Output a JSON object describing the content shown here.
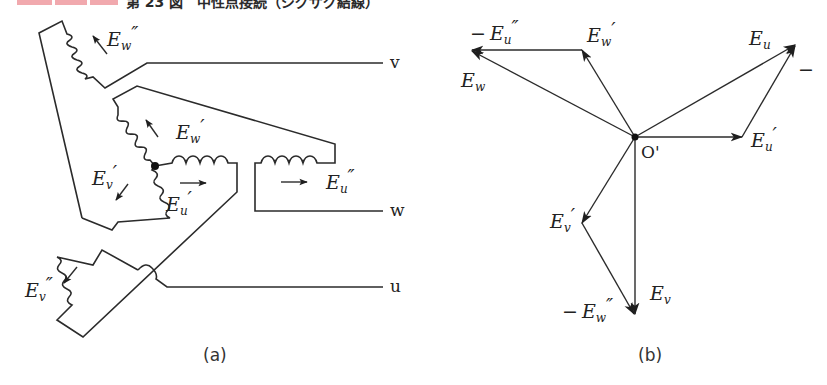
{
  "header": {
    "tag_boxes": [
      "",
      "",
      ""
    ],
    "tag_color": "#f1a9ae",
    "title_cut": "第 23 図　中性点接続（ジグザグ結線）"
  },
  "figure_a": {
    "caption": "(a)",
    "terminals": {
      "v": "v",
      "w": "w",
      "u": "u"
    },
    "windings": [
      {
        "id": "Ew2",
        "base": "E",
        "sub": "w",
        "prime": "″"
      },
      {
        "id": "Ew1",
        "base": "E",
        "sub": "w",
        "prime": "′"
      },
      {
        "id": "Ev1",
        "base": "E",
        "sub": "v",
        "prime": "′"
      },
      {
        "id": "Eu1",
        "base": "E",
        "sub": "u",
        "prime": "′"
      },
      {
        "id": "Eu2",
        "base": "E",
        "sub": "u",
        "prime": "″"
      },
      {
        "id": "Ev2",
        "base": "E",
        "sub": "v",
        "prime": "″"
      }
    ]
  },
  "figure_b": {
    "caption": "(b)",
    "origin_label": "O'",
    "phasors": [
      {
        "id": "neg_Eu2",
        "sign": "−",
        "base": "E",
        "sub": "u",
        "prime": "″"
      },
      {
        "id": "Ew1",
        "sign": "",
        "base": "E",
        "sub": "w",
        "prime": "′"
      },
      {
        "id": "Ew",
        "sign": "",
        "base": "E",
        "sub": "w",
        "prime": ""
      },
      {
        "id": "Eu",
        "sign": "",
        "base": "E",
        "sub": "u",
        "prime": ""
      },
      {
        "id": "Eu1",
        "sign": "",
        "base": "E",
        "sub": "u",
        "prime": "′"
      },
      {
        "id": "Ev1",
        "sign": "",
        "base": "E",
        "sub": "v",
        "prime": "′"
      },
      {
        "id": "Ev",
        "sign": "",
        "base": "E",
        "sub": "v",
        "prime": ""
      },
      {
        "id": "neg_Ew2",
        "sign": "−",
        "base": "E",
        "sub": "w",
        "prime": "″"
      }
    ],
    "edge_mark": "−"
  }
}
